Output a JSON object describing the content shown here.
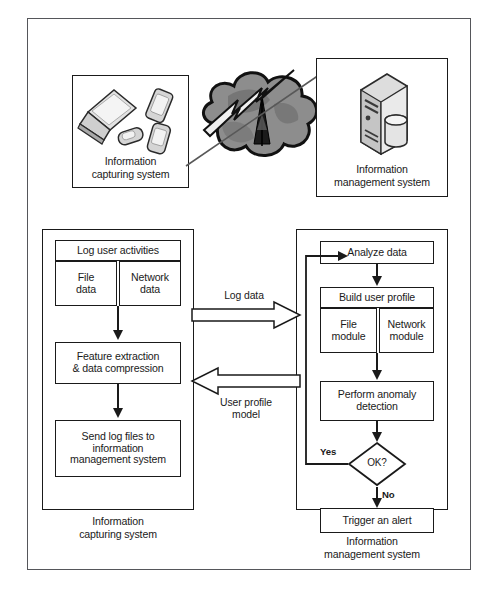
{
  "figure": {
    "frame": {
      "name": "outer-frame"
    }
  },
  "top_section": {
    "capture_panel": {
      "caption_line1": "Information",
      "caption_line2": "capturing system",
      "icons": [
        "laptop-icon",
        "tablet-icon",
        "flip-phone-icon",
        "smartphone-icon"
      ]
    },
    "network": {
      "cloud": "cloud-icon",
      "lightning": "lightning-bolt-icon",
      "antenna": "antenna-tower-icon"
    },
    "management_panel": {
      "caption_line1": "Information",
      "caption_line2": "management system",
      "icons": [
        "server-tower-icon",
        "database-cylinder-icon"
      ]
    }
  },
  "left_flow": {
    "panel_caption_line1": "Information",
    "panel_caption_line2": "capturing system",
    "nodes": {
      "log_user_activities": "Log user activities",
      "file_data_line1": "File",
      "file_data_line2": "data",
      "network_data_line1": "Network",
      "network_data_line2": "data",
      "feature_extraction_line1": "Feature extraction",
      "feature_extraction_line2": "& data compression",
      "send_logs_line1": "Send log files to",
      "send_logs_line2": "information",
      "send_logs_line3": "management system"
    }
  },
  "right_flow": {
    "panel_caption_line1": "Information",
    "panel_caption_line2": "management system",
    "nodes": {
      "analyze_data": "Analyze data",
      "build_user_profile": "Build user profile",
      "file_module_line1": "File",
      "file_module_line2": "module",
      "network_module_line1": "Network",
      "network_module_line2": "module",
      "perform_anomaly_line1": "Perform anomaly",
      "perform_anomaly_line2": "detection",
      "decision": "OK?",
      "trigger_alert": "Trigger an alert"
    },
    "branches": {
      "yes": "Yes",
      "no": "No"
    }
  },
  "connectors": {
    "log_data_label": "Log data",
    "user_profile_label_line1": "User profile",
    "user_profile_label_line2": "model"
  },
  "colors": {
    "stroke": "#1a1a1a",
    "frame": "#55565a",
    "cloud_fill": "#8d8d8d",
    "cloud_shade": "#707070",
    "device_fill": "#d9d9d9",
    "device_shade": "#a8a8a8",
    "background": "#ffffff"
  }
}
